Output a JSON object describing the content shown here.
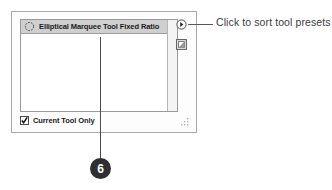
{
  "panel": {
    "name": "Tool Presets panel",
    "preset_list": {
      "rows": [
        {
          "label": "Elliptical Marquee Tool Fixed Ratio",
          "icon": "elliptical-marquee-icon",
          "selected": true
        }
      ]
    },
    "current_tool_only": {
      "label": "Current Tool Only",
      "checked": true
    },
    "buttons": [
      {
        "icon": "panel-menu-icon",
        "name": "panel-menu-button"
      },
      {
        "icon": "new-tool-preset-icon",
        "name": "new-tool-preset-button"
      }
    ],
    "resize_grip": "resize-grip-icon"
  },
  "annotation": {
    "text": "Click to sort tool presets"
  },
  "callout": {
    "number": "6"
  },
  "colors": {
    "panel_border": "#a9a9a9",
    "selected_row": "#cfcfcf",
    "text": "#1b1b1b",
    "annotation_text": "#3b3b3d",
    "badge_bg": "#2f2f31",
    "leader_line": "#4a4a4c"
  }
}
